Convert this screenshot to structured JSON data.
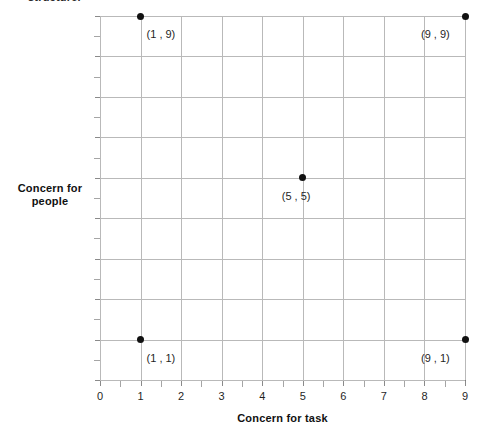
{
  "top_caption": "structure.",
  "chart_data": {
    "type": "scatter",
    "title": "",
    "xlabel": "Concern for task",
    "ylabel": "Concern for people",
    "xlim": [
      0,
      9
    ],
    "ylim": [
      0,
      9
    ],
    "xticks": [
      0,
      1,
      2,
      3,
      4,
      5,
      6,
      7,
      8,
      9
    ],
    "yticks": [
      0,
      1,
      2,
      3,
      4,
      5,
      6,
      7,
      8,
      9
    ],
    "minor_tick_step": 0.5,
    "grid": true,
    "legend": "none",
    "marker_color": "#111111",
    "grid_color": "#b9b9b9",
    "axis_color": "#7a7a7a",
    "points": [
      {
        "x": 1,
        "y": 9,
        "label": "(1 , 9)",
        "label_pos": "right-below"
      },
      {
        "x": 9,
        "y": 9,
        "label": "(9 , 9)",
        "label_pos": "left-below"
      },
      {
        "x": 5,
        "y": 5,
        "label": "(5 , 5)",
        "label_pos": "center-below"
      },
      {
        "x": 1,
        "y": 1,
        "label": "(1 , 1)",
        "label_pos": "right-below"
      },
      {
        "x": 9,
        "y": 1,
        "label": "(9 , 1)",
        "label_pos": "left-below"
      }
    ]
  },
  "y_axis_title_lines": [
    "Concern for",
    "people"
  ]
}
